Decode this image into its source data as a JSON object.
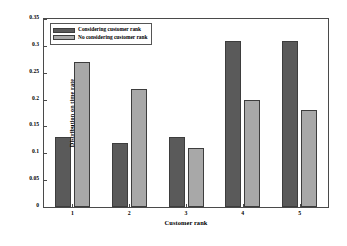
{
  "chart_data": {
    "type": "bar",
    "title": "",
    "xlabel": "Customer rank",
    "ylabel": "Distribution on time rate",
    "categories": [
      "1",
      "2",
      "3",
      "4",
      "5"
    ],
    "series": [
      {
        "name": "Considering customer rank",
        "color": "#5a5a5a",
        "values": [
          0.13,
          0.12,
          0.13,
          0.31,
          0.31
        ]
      },
      {
        "name": "No considering customer rank",
        "color": "#a8a8a8",
        "values": [
          0.27,
          0.22,
          0.11,
          0.2,
          0.18
        ]
      }
    ],
    "ylim": [
      0,
      0.35
    ],
    "ytick_labels": [
      "0",
      "0.05",
      "0.1",
      "0.15",
      "0.2",
      "0.25",
      "0.3",
      "0.35"
    ],
    "ytick_values": [
      0,
      0.05,
      0.1,
      0.15,
      0.2,
      0.25,
      0.3,
      0.35
    ],
    "xtick_labels": [
      "1",
      "2",
      "3",
      "4",
      "5"
    ],
    "grid": false,
    "legend_position": "upper left"
  },
  "legend": {
    "entries": [
      {
        "label": "Considering customer rank",
        "color": "#5a5a5a"
      },
      {
        "label": "No considering customer rank",
        "color": "#a8a8a8"
      }
    ]
  }
}
